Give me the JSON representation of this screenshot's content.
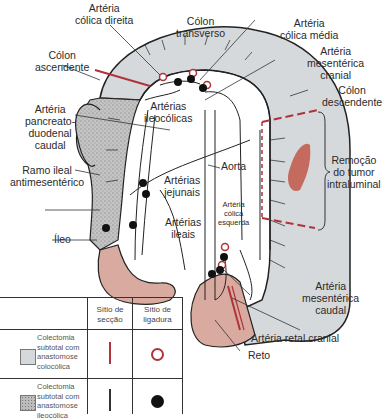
{
  "colors": {
    "colon_gray": "#d6d9dc",
    "stippled": "#b9b9b9",
    "ileum_pink": "#d9aaa0",
    "tumor": "#c46a5e",
    "section_red": "#b0323a",
    "ligature_black": "#111111",
    "outline": "#222222"
  },
  "labels": {
    "arteria_colica_direita": [
      "Artéria",
      "cólica direita"
    ],
    "colon_transverso": [
      "Cólon",
      "transverso"
    ],
    "arteria_colica_media": [
      "Artéria",
      "cólica média"
    ],
    "arteria_mesenterica_cranial": [
      "Artéria",
      "mesentérica",
      "cranial"
    ],
    "colon_ascendente": [
      "Cólon",
      "ascendente"
    ],
    "colon_descendente": [
      "Cólon",
      "descendente"
    ],
    "arterias_ileocolicas": [
      "Artérias",
      "ileocólicas"
    ],
    "arteria_pancreatoduodenal_caudal": [
      "Artéria",
      "pancreato-",
      "duodenal",
      "caudal"
    ],
    "remocao_tumor": [
      "Remoção",
      "do tumor",
      "intraluminal"
    ],
    "ramo_ileal": [
      "Ramo ileal",
      "antimesentérico"
    ],
    "arterias_jejunais": [
      "Artérias",
      "jejunais"
    ],
    "aorta": "Aorta",
    "arteria_colica_esquerda": [
      "Artéria",
      "cólica",
      "esquerda"
    ],
    "arterias_ileais": [
      "Artérias",
      "ileais"
    ],
    "ileo": "Íleo",
    "arteria_mesenterica_caudal": [
      "Artéria",
      "mesentérica",
      "caudal"
    ],
    "arteria_retal_cranial": "Artéria retal cranial",
    "reto": "Reto"
  },
  "legend": {
    "headers": {
      "section_site": [
        "Sítio de",
        "secção"
      ],
      "ligature_site": [
        "Sítio de",
        "ligadura"
      ]
    },
    "rows": [
      {
        "swatch": "gray",
        "description": [
          "Colectomia",
          "subtotal com",
          "anastomose",
          "colocólica"
        ],
        "section_marker": "red-line",
        "ligature_marker": "red-ring"
      },
      {
        "swatch": "stippled",
        "description": [
          "Colectomia",
          "subtotal com",
          "anastomose",
          "ileocólica"
        ],
        "section_marker": "black-line",
        "ligature_marker": "black-dot"
      }
    ]
  }
}
